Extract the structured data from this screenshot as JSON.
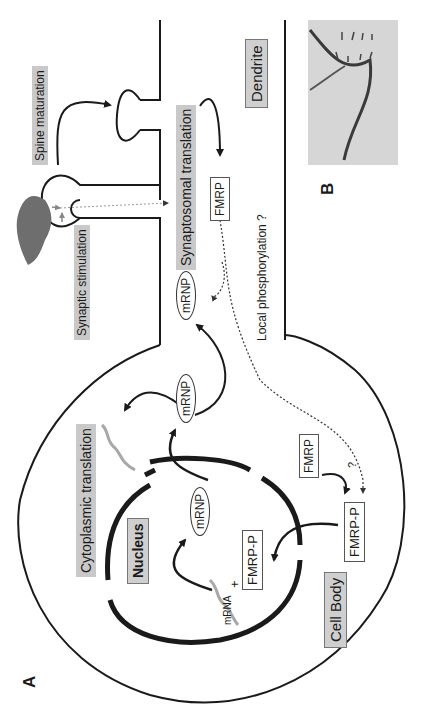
{
  "figure": {
    "panels": [
      {
        "id": "A",
        "label": "A",
        "description": "Schematic of neuron: cell body with nucleus, dendrite with spines"
      },
      {
        "id": "B",
        "label": "B",
        "description": "Micrograph of dendrite with spines"
      }
    ],
    "orientation": "rotated 90 degrees counter-clockwise",
    "labels": {
      "spine_maturation": "Spine maturation",
      "synaptic_stimulation": "Synaptic stimulation",
      "synaptosomal_translation": "Synaptosomal translation",
      "dendrite": "Dendrite",
      "fmrp_dendrite": "FMRP",
      "local_phosphorylation": "Local phosphorylation ?",
      "mrnp_dendrite": "mRNP",
      "mrnp_cytoplasm": "mRNP",
      "mrnp_nucleus": "mRNP",
      "cytoplasmic_translation": "Cytoplasmic translation",
      "nucleus": "Nucleus",
      "fmrp_cytoplasm": "FMRP",
      "question_mark": "?",
      "fmrp_p_cytoplasm": "FMRP-P",
      "fmrp_p_nucleus": "FMRP-P",
      "plus": "+",
      "mrna": "mRNA",
      "cell_body": "Cell Body",
      "panel_a": "A",
      "panel_b": "B"
    },
    "colors": {
      "line": "#1a1a1a",
      "label_fill": "#c9c9c9",
      "presynaptic_terminal": "#6e6e6e",
      "mrna_strand": "#a8a8a8",
      "dotted": "#444444"
    }
  }
}
